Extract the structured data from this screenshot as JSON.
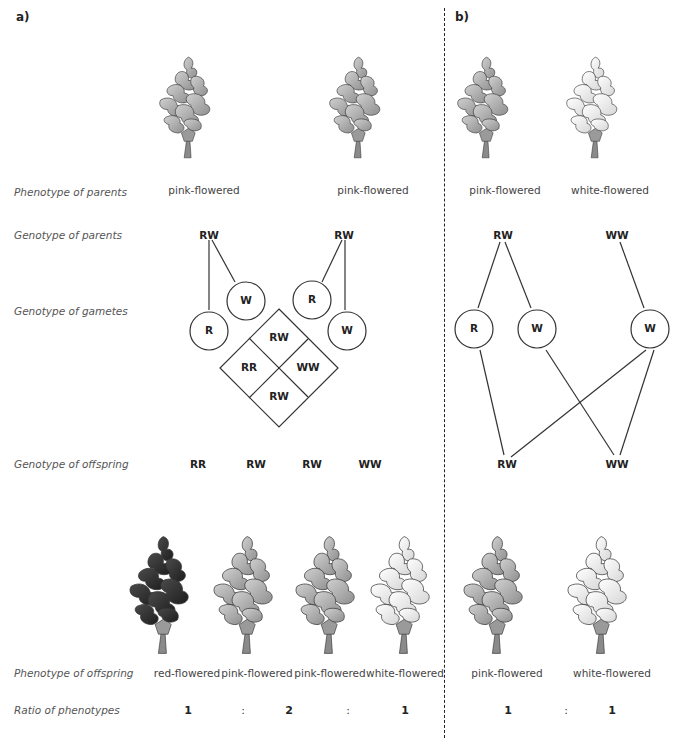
{
  "panels": {
    "a": "a)",
    "b": "b)"
  },
  "row_labels": {
    "phenotype_parents": "Phenotype of parents",
    "genotype_parents": "Genotype of parents",
    "genotype_gametes": "Genotype of gametes",
    "genotype_offspring": "Genotype of offspring",
    "phenotype_offspring": "Phenotype of offspring",
    "ratio": "Ratio of phenotypes"
  },
  "panel_a": {
    "parents": [
      {
        "phenotype": "pink-flowered",
        "genotype": "RW",
        "color": "pink"
      },
      {
        "phenotype": "pink-flowered",
        "genotype": "RW",
        "color": "pink"
      }
    ],
    "gametes": [
      "R",
      "W",
      "R",
      "W"
    ],
    "punnett": {
      "top": "RW",
      "left": "RR",
      "right": "WW",
      "bottom": "RW"
    },
    "offspring": [
      {
        "genotype": "RR",
        "phenotype": "red-flowered",
        "color": "red"
      },
      {
        "genotype": "RW",
        "phenotype": "pink-flowered",
        "color": "pink"
      },
      {
        "genotype": "RW",
        "phenotype": "pink-flowered",
        "color": "pink"
      },
      {
        "genotype": "WW",
        "phenotype": "white-flowered",
        "color": "white"
      }
    ],
    "ratio": {
      "r1": "1",
      "c1": ":",
      "r2": "2",
      "c2": ":",
      "r3": "1"
    }
  },
  "panel_b": {
    "parents": [
      {
        "phenotype": "pink-flowered",
        "genotype": "RW",
        "color": "pink"
      },
      {
        "phenotype": "white-flowered",
        "genotype": "WW",
        "color": "white"
      }
    ],
    "gametes": [
      "R",
      "W",
      "W"
    ],
    "offspring": [
      {
        "genotype": "RW",
        "phenotype": "pink-flowered",
        "color": "pink"
      },
      {
        "genotype": "WW",
        "phenotype": "white-flowered",
        "color": "white"
      }
    ],
    "ratio": {
      "r1": "1",
      "c1": ":",
      "r2": "1"
    }
  },
  "colors": {
    "red_fill": "#3a3a3a",
    "pink_fill": "#b8b8b8",
    "white_fill": "#f4f4f4",
    "stem": "#8a8a8a",
    "outline": "#333333"
  }
}
